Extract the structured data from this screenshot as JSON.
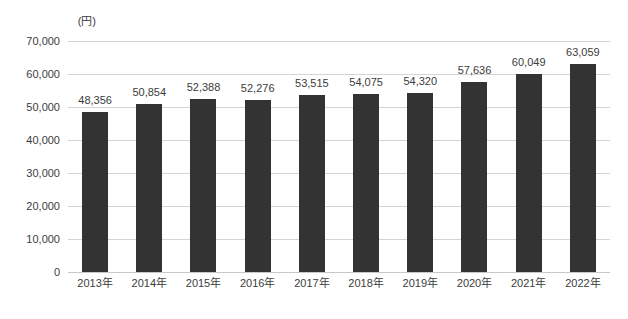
{
  "chart_data": {
    "type": "bar",
    "title": "",
    "subtitle": "",
    "xlabel": "",
    "ylabel": "",
    "unit_label": "(円)",
    "categories": [
      "2013年",
      "2014年",
      "2015年",
      "2016年",
      "2017年",
      "2018年",
      "2019年",
      "2020年",
      "2021年",
      "2022年"
    ],
    "values": [
      48356,
      50854,
      52388,
      52276,
      53515,
      54075,
      54320,
      57636,
      60049,
      63059
    ],
    "value_labels": [
      "48,356",
      "50,854",
      "52,388",
      "52,276",
      "53,515",
      "54,075",
      "54,320",
      "57,636",
      "60,049",
      "63,059"
    ],
    "ylim": [
      0,
      70000
    ],
    "ytick_values": [
      0,
      10000,
      20000,
      30000,
      40000,
      50000,
      60000,
      70000
    ],
    "ytick_labels": [
      "0",
      "10,000",
      "20,000",
      "30,000",
      "40,000",
      "50,000",
      "60,000",
      "70,000"
    ],
    "grid": true,
    "legend": false,
    "legend_position": "none",
    "series": [
      {
        "name": "",
        "values": [
          48356,
          50854,
          52388,
          52276,
          53515,
          54075,
          54320,
          57636,
          60049,
          63059
        ],
        "color": "#333333"
      }
    ]
  },
  "colors": {
    "bar": "#333333",
    "gridline": "#d4d4d4",
    "baseline": "#c8c8c8",
    "text": "#3c3c3c",
    "background": "#ffffff"
  }
}
